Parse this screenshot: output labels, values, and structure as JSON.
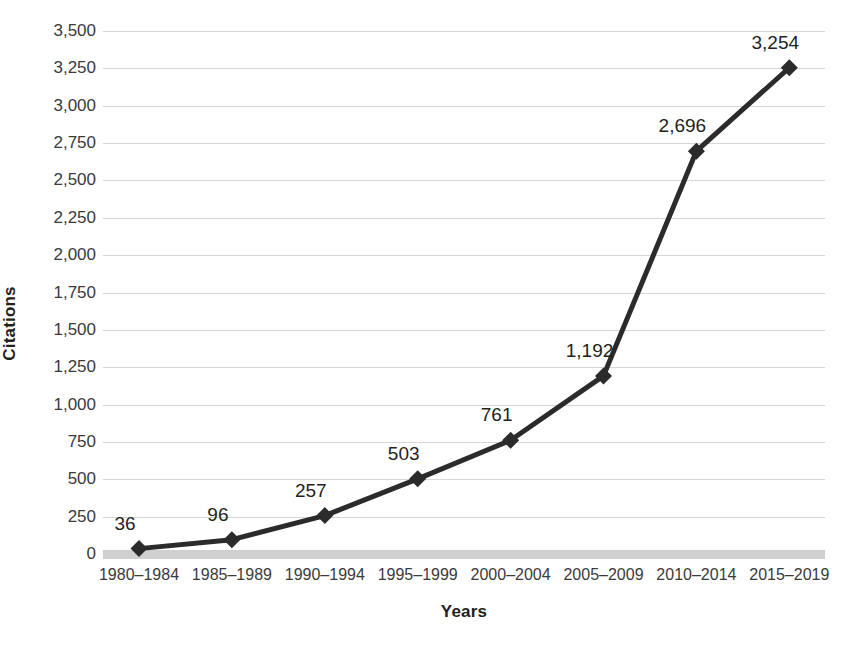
{
  "chart_data": {
    "type": "line",
    "title": "",
    "xlabel": "Years",
    "ylabel": "Citations",
    "categories": [
      "1980–1984",
      "1985–1989",
      "1990–1994",
      "1995–1999",
      "2000–2004",
      "2005–2009",
      "2010–2014",
      "2015–2019"
    ],
    "values": [
      36,
      96,
      257,
      503,
      761,
      1192,
      2696,
      3254
    ],
    "point_labels": [
      "36",
      "96",
      "257",
      "503",
      "761",
      "1,192",
      "2,696",
      "3,254"
    ],
    "ylim": [
      0,
      3500
    ],
    "ytick_step": 250,
    "ytick_labels": [
      "3,500",
      "3,250",
      "3,000",
      "2,750",
      "2,500",
      "2,250",
      "2,000",
      "1,750",
      "1,500",
      "1,250",
      "1,000",
      "750",
      "500",
      "250",
      "0"
    ],
    "ytick_values": [
      3500,
      3250,
      3000,
      2750,
      2500,
      2250,
      2000,
      1750,
      1500,
      1250,
      1000,
      750,
      500,
      250,
      0
    ],
    "grid": true,
    "legend": "none",
    "marker": "diamond",
    "series_color": "#2b2b2b",
    "grid_color": "#d6d6d6",
    "baseline_color": "#cfcfcf",
    "text_color": "#231f20",
    "background_color": "#ffffff"
  }
}
